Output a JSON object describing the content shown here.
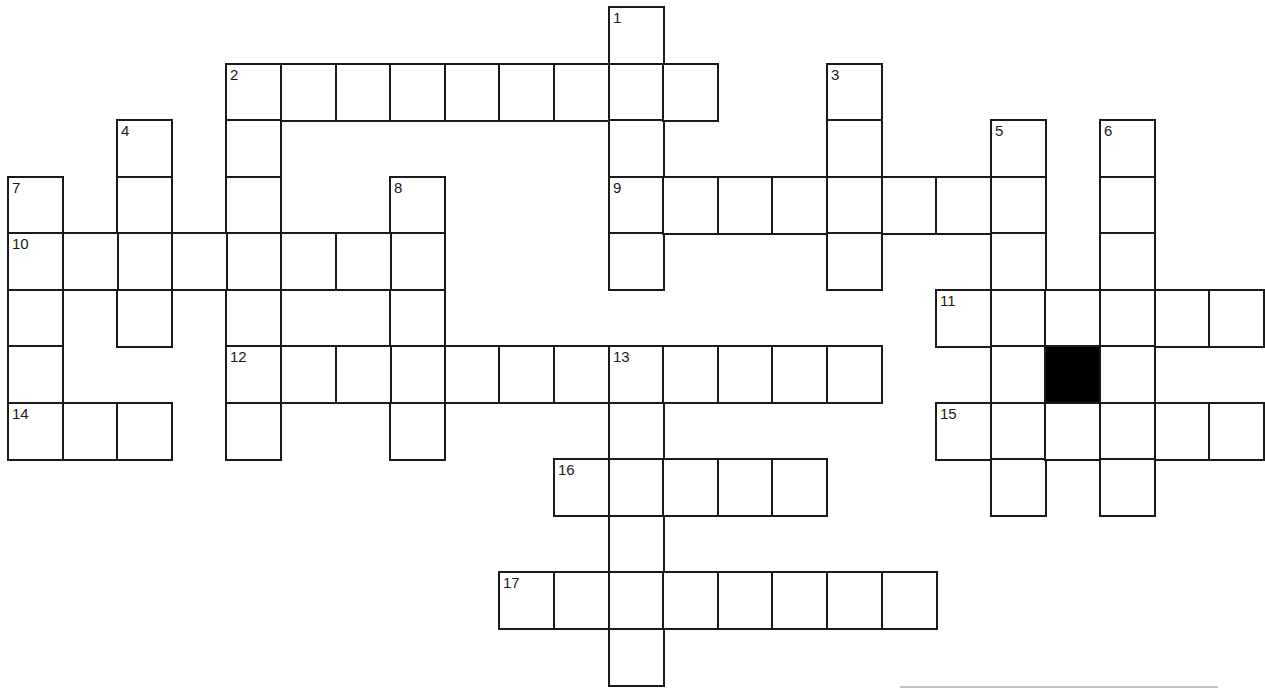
{
  "puzzle": {
    "type": "crossword",
    "grid": {
      "origin_x": 8,
      "origin_y": 7,
      "cell_w": 54.6,
      "cell_h": 56.5,
      "cols": 23,
      "rows": 12
    },
    "colors": {
      "line": "#1a1a1a",
      "block": "#000000",
      "background": "#ffffff"
    },
    "entries": [
      {
        "number": "1",
        "direction": "down",
        "row": 0,
        "col": 11,
        "length": 5
      },
      {
        "number": "2",
        "direction": "across",
        "row": 1,
        "col": 4,
        "length": 9
      },
      {
        "number": "2",
        "direction": "down",
        "row": 1,
        "col": 4,
        "length": 7
      },
      {
        "number": "3",
        "direction": "down",
        "row": 1,
        "col": 15,
        "length": 4
      },
      {
        "number": "4",
        "direction": "down",
        "row": 2,
        "col": 2,
        "length": 4
      },
      {
        "number": "5",
        "direction": "down",
        "row": 2,
        "col": 18,
        "length": 7
      },
      {
        "number": "6",
        "direction": "down",
        "row": 2,
        "col": 20,
        "length": 7
      },
      {
        "number": "7",
        "direction": "down",
        "row": 3,
        "col": 0,
        "length": 5
      },
      {
        "number": "8",
        "direction": "down",
        "row": 3,
        "col": 7,
        "length": 5
      },
      {
        "number": "9",
        "direction": "across",
        "row": 3,
        "col": 11,
        "length": 8
      },
      {
        "number": "10",
        "direction": "across",
        "row": 4,
        "col": 0,
        "length": 8
      },
      {
        "number": "11",
        "direction": "across",
        "row": 5,
        "col": 17,
        "length": 6
      },
      {
        "number": "12",
        "direction": "across",
        "row": 6,
        "col": 4,
        "length": 12
      },
      {
        "number": "13",
        "direction": "down",
        "row": 6,
        "col": 11,
        "length": 6
      },
      {
        "number": "14",
        "direction": "across",
        "row": 7,
        "col": 0,
        "length": 3
      },
      {
        "number": "15",
        "direction": "across",
        "row": 7,
        "col": 17,
        "length": 6
      },
      {
        "number": "16",
        "direction": "across",
        "row": 8,
        "col": 10,
        "length": 5
      },
      {
        "number": "17",
        "direction": "across",
        "row": 10,
        "col": 9,
        "length": 8
      }
    ],
    "black_cells": [
      {
        "row": 6,
        "col": 19
      }
    ],
    "scan_artifact": {
      "x": 900,
      "y": 686,
      "width": 318
    }
  }
}
